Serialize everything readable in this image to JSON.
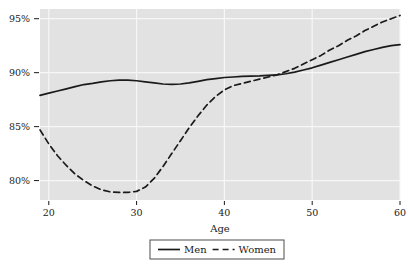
{
  "chart_data": {
    "type": "line",
    "title": "",
    "xlabel": "Age",
    "ylabel": "",
    "xlim": [
      19,
      60
    ],
    "ylim": [
      78.2,
      95.9
    ],
    "grid": true,
    "x_ticks": [
      20,
      30,
      40,
      50,
      60
    ],
    "x_tick_labels": [
      "20",
      "30",
      "40",
      "50",
      "60"
    ],
    "y_ticks": [
      80,
      85,
      90,
      95
    ],
    "y_tick_labels": [
      "80%",
      "85%",
      "90%",
      "95%"
    ],
    "legend_position": "bottom-center",
    "x": [
      19,
      20,
      21,
      22,
      23,
      24,
      25,
      26,
      27,
      28,
      29,
      30,
      31,
      32,
      33,
      34,
      35,
      36,
      37,
      38,
      39,
      40,
      41,
      42,
      43,
      44,
      45,
      46,
      47,
      48,
      49,
      50,
      51,
      52,
      53,
      54,
      55,
      56,
      57,
      58,
      59,
      60
    ],
    "series": [
      {
        "name": "Men",
        "style": "solid",
        "color": "#1a1a1a",
        "values": [
          87.9,
          88.1,
          88.3,
          88.5,
          88.7,
          88.9,
          89.0,
          89.15,
          89.25,
          89.3,
          89.3,
          89.25,
          89.15,
          89.05,
          88.95,
          88.92,
          88.95,
          89.05,
          89.2,
          89.35,
          89.45,
          89.55,
          89.6,
          89.65,
          89.68,
          89.7,
          89.75,
          89.8,
          89.9,
          90.05,
          90.25,
          90.45,
          90.7,
          90.95,
          91.2,
          91.45,
          91.7,
          91.95,
          92.15,
          92.35,
          92.5,
          92.6
        ]
      },
      {
        "name": "Women",
        "style": "dashed",
        "color": "#1a1a1a",
        "values": [
          84.7,
          83.4,
          82.3,
          81.4,
          80.6,
          80.0,
          79.5,
          79.15,
          78.95,
          78.9,
          78.9,
          79.0,
          79.4,
          80.2,
          81.3,
          82.5,
          83.7,
          84.9,
          86.0,
          87.0,
          87.8,
          88.4,
          88.8,
          89.0,
          89.2,
          89.4,
          89.6,
          89.8,
          90.1,
          90.4,
          90.8,
          91.2,
          91.6,
          92.1,
          92.5,
          93.0,
          93.4,
          93.9,
          94.3,
          94.7,
          95.0,
          95.3
        ]
      }
    ],
    "legend": [
      {
        "label": "Men",
        "style": "solid"
      },
      {
        "label": "Women",
        "style": "dashed"
      }
    ],
    "colors": {
      "plot_background": "#e2e2e2",
      "gridline": "#f7f7f7",
      "text": "#1a1a1a",
      "line": "#1a1a1a",
      "legend_border": "#4d4d4d",
      "page_background": "#ffffff"
    }
  }
}
